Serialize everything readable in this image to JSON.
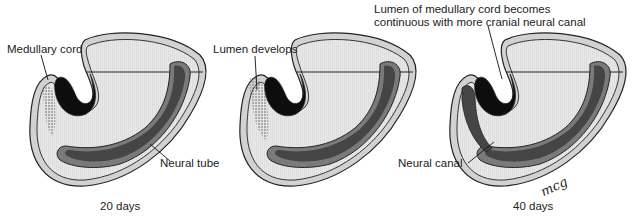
{
  "figure": {
    "panels": [
      {
        "caption": "20 days",
        "labels": {
          "medullary_cord": "Medullary cord",
          "neural_tube": "Neural tube"
        }
      },
      {
        "caption": "",
        "labels": {
          "lumen_develops": "Lumen develops"
        }
      },
      {
        "caption": "40 days",
        "labels": {
          "lumen_continuous_line1": "Lumen of medullary cord becomes",
          "lumen_continuous_line2": "continuous with more cranial neural canal",
          "neural_canal": "Neural canal"
        }
      }
    ],
    "signature": "mcg",
    "colors": {
      "outline": "#222222",
      "body_fill": "#e6e6e6",
      "outer_layer": "#d0d0d0",
      "neural_tube": "#4a4a4a",
      "neural_tube_rim": "#7a7a7a",
      "gut_black": "#0d0d0d",
      "stipple": "#555555"
    }
  }
}
